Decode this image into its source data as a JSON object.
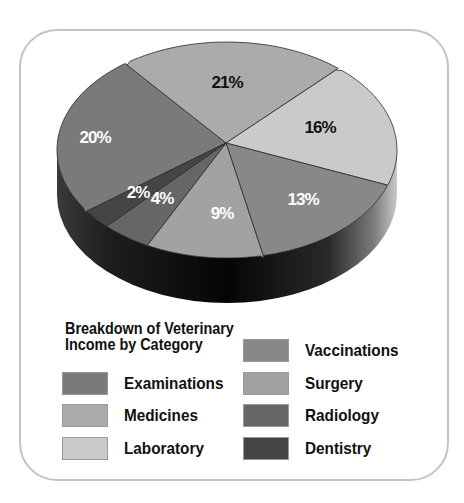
{
  "chart_data": {
    "type": "pie",
    "style": "3d",
    "title": "Breakdown of Veterinary Income by Category",
    "title_lines": [
      "Breakdown of Veterinary",
      "Income by Category"
    ],
    "categories": [
      "Examinations",
      "Medicines",
      "Laboratory",
      "Vaccinations",
      "Surgery",
      "Radiology",
      "Dentistry"
    ],
    "values": [
      20,
      21,
      16,
      13,
      9,
      4,
      2
    ],
    "labels": [
      "20%",
      "21%",
      "16%",
      "13%",
      "9%",
      "4%",
      "2%"
    ],
    "colors": [
      "#7a7a7a",
      "#ababab",
      "#cacaca",
      "#888888",
      "#a2a2a2",
      "#666666",
      "#454545"
    ],
    "label_colors": [
      "#ffffff",
      "#111111",
      "#111111",
      "#ffffff",
      "#ffffff",
      "#ffffff",
      "#ffffff"
    ],
    "legend_position": "bottom"
  },
  "legend": {
    "items": [
      {
        "label": "Examinations",
        "color": "#7a7a7a"
      },
      {
        "label": "Medicines",
        "color": "#ababab"
      },
      {
        "label": "Laboratory",
        "color": "#cacaca"
      },
      {
        "label": "Vaccinations",
        "color": "#888888"
      },
      {
        "label": "Surgery",
        "color": "#a2a2a2"
      },
      {
        "label": "Radiology",
        "color": "#666666"
      },
      {
        "label": "Dentistry",
        "color": "#454545"
      }
    ]
  }
}
